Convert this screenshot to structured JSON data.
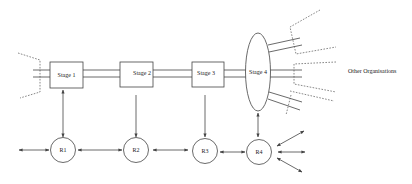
{
  "diagram": {
    "stages": [
      {
        "id": "stage1",
        "label": "Stage 1",
        "shape": "rect"
      },
      {
        "id": "stage2",
        "label": "Stage 2",
        "shape": "rect"
      },
      {
        "id": "stage3",
        "label": "Stage 3",
        "shape": "rect"
      },
      {
        "id": "stage4",
        "label": "Stage 4",
        "shape": "ellipse"
      }
    ],
    "resources": [
      {
        "id": "r1",
        "label": "R1"
      },
      {
        "id": "r2",
        "label": "R2"
      },
      {
        "id": "r3",
        "label": "R3"
      },
      {
        "id": "r4",
        "label": "R4"
      }
    ],
    "external_label": "Other Organisations",
    "connections": [
      {
        "from": "stage1",
        "to": "stage2",
        "type": "double-line"
      },
      {
        "from": "stage2",
        "to": "stage3",
        "type": "double-line"
      },
      {
        "from": "stage3",
        "to": "stage4",
        "type": "double-line"
      },
      {
        "from": "stage1",
        "to": "r1",
        "type": "bidirectional-arrow"
      },
      {
        "from": "stage2",
        "to": "r2",
        "type": "arrow"
      },
      {
        "from": "stage3",
        "to": "r3",
        "type": "arrow"
      },
      {
        "from": "stage4",
        "to": "r4",
        "type": "bidirectional-arrow"
      },
      {
        "from": "r1",
        "to": "r2",
        "type": "bidirectional-arrow"
      },
      {
        "from": "r2",
        "to": "r3",
        "type": "bidirectional-arrow"
      },
      {
        "from": "r3",
        "to": "r4",
        "type": "bidirectional-arrow"
      },
      {
        "from": "r4",
        "to": "external",
        "type": "bidirectional-arrow",
        "count": 3
      },
      {
        "from": "external",
        "to": "r1",
        "type": "bidirectional-arrow"
      }
    ]
  }
}
